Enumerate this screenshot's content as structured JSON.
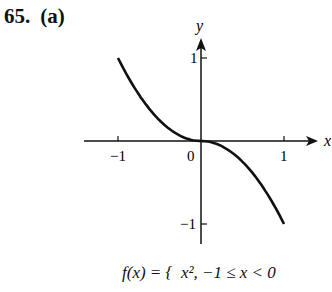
{
  "problem": {
    "number": "65.",
    "part": "(a)"
  },
  "chart_data": {
    "type": "line",
    "title": "",
    "xlabel": "x",
    "ylabel": "y",
    "xlim": [
      -1.4,
      1.4
    ],
    "ylim": [
      -1.2,
      1.1
    ],
    "x_ticks": [
      {
        "value": -1,
        "label": "−1"
      },
      {
        "value": 0,
        "label": "0"
      },
      {
        "value": 1,
        "label": "1"
      }
    ],
    "y_ticks": [
      {
        "value": 1,
        "label": "1"
      },
      {
        "value": -1,
        "label": "−1"
      }
    ],
    "grid": false,
    "series": [
      {
        "name": "f(x) = x^2, -1 ≤ x < 0",
        "x": [
          -1,
          -0.75,
          -0.5,
          -0.25,
          0
        ],
        "y": [
          1,
          0.5625,
          0.25,
          0.0625,
          0
        ]
      },
      {
        "name": "f(x) = -x^2, 0 ≤ x ≤ 1",
        "x": [
          0,
          0.25,
          0.5,
          0.75,
          1
        ],
        "y": [
          0,
          -0.0625,
          -0.25,
          -0.5625,
          -1
        ]
      }
    ]
  },
  "formula": {
    "lhs": "f(x) = {",
    "case1": "x², −1 ≤ x < 0"
  }
}
